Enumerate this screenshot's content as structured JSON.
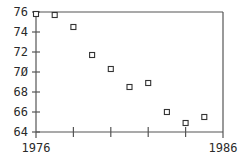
{
  "chart_data": {
    "type": "scatter",
    "title": "",
    "xlabel": "",
    "ylabel": "",
    "xlim": [
      1976,
      1986
    ],
    "ylim": [
      64,
      76
    ],
    "x_tick_labels": [
      "1976",
      "1986"
    ],
    "x_ticks": [
      1976,
      1978,
      1980,
      1982,
      1984,
      1986
    ],
    "y_tick_labels": [
      "76",
      "74",
      "72",
      "70",
      "68",
      "66",
      "64"
    ],
    "y_ticks": [
      76,
      74,
      72,
      70,
      68,
      66,
      64
    ],
    "grid": false,
    "legend": null,
    "marker": "open-square",
    "series": [
      {
        "name": "series-1",
        "x": [
          1976,
          1977,
          1978,
          1979,
          1980,
          1981,
          1982,
          1983,
          1984,
          1985
        ],
        "y": [
          75.8,
          75.7,
          74.5,
          71.7,
          70.3,
          68.5,
          68.9,
          66.0,
          64.9,
          65.5
        ]
      }
    ],
    "colors": {
      "axis": "#555555",
      "marker": "#333333",
      "text": "#2a2a2a"
    }
  }
}
